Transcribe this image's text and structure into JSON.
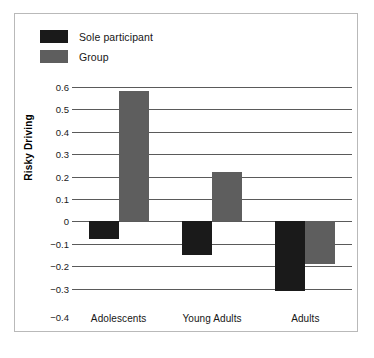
{
  "chart_data": {
    "type": "bar",
    "title": "",
    "xlabel": "",
    "ylabel": "Risky Driving",
    "categories": [
      "Adolescents",
      "Young Adults",
      "Adults"
    ],
    "series": [
      {
        "name": "Sole participant",
        "color": "#1a1a1a",
        "values": [
          -0.08,
          -0.15,
          -0.31
        ]
      },
      {
        "name": "Group",
        "color": "#5e5e5e",
        "values": [
          0.58,
          0.22,
          -0.19
        ]
      }
    ],
    "ylim": [
      -0.4,
      0.6
    ],
    "ytick_step": 0.1,
    "ytick_labels": [
      "0.6",
      "0.5",
      "0.4",
      "0.3",
      "0.2",
      "0.1",
      "0",
      "−0.1",
      "−0.2",
      "−0.3",
      "−0.4"
    ],
    "ytick_values": [
      0.6,
      0.5,
      0.4,
      0.3,
      0.2,
      0.1,
      0,
      -0.1,
      -0.2,
      -0.3,
      -0.4
    ],
    "grid": true,
    "legend_position": "top-left"
  },
  "legend": {
    "items": [
      {
        "label": "Sole participant",
        "color": "#1a1a1a"
      },
      {
        "label": "Group",
        "color": "#5e5e5e"
      }
    ]
  },
  "colors": {
    "sole_participant": "#1a1a1a",
    "group": "#5e5e5e",
    "gridline": "#5a5a5a",
    "frame": "#b9b9b9",
    "text": "#161616"
  }
}
